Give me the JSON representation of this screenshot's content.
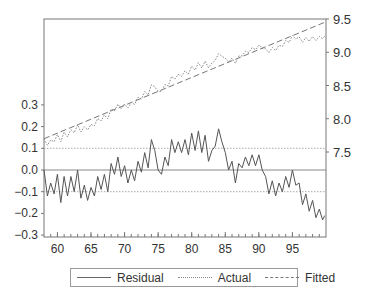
{
  "chart_data": {
    "type": "line",
    "title": "",
    "xlabel": "",
    "ylabel_left": "Residual",
    "ylabel_right": "Actual / Fitted",
    "x_ticks": [
      60,
      65,
      70,
      75,
      80,
      85,
      90,
      95
    ],
    "x_tick_labels": [
      "60",
      "65",
      "70",
      "75",
      "80",
      "85",
      "90",
      "95"
    ],
    "xlim": [
      58,
      100
    ],
    "y_left_ticks": [
      0.3,
      0.2,
      0.1,
      0.0,
      -0.1,
      -0.2,
      -0.3
    ],
    "y_left_tick_labels": [
      "0.3",
      "0.2",
      "0.1",
      "0.0",
      "−0.1",
      "−0.2",
      "−0.3"
    ],
    "y_left_lim": [
      -0.3,
      0.7
    ],
    "y_right_ticks": [
      9.5,
      9.0,
      8.5,
      8.0,
      7.5
    ],
    "y_right_tick_labels": [
      "9.5",
      "9.0",
      "8.5",
      "8.0",
      "7.5"
    ],
    "y_right_lim": [
      7.14,
      9.5
    ],
    "reference_lines_residual": [
      0.1,
      0.0,
      -0.1
    ],
    "x": [
      58,
      58.5,
      59,
      59.5,
      60,
      60.5,
      61,
      61.5,
      62,
      62.5,
      63,
      63.5,
      64,
      64.5,
      65,
      65.5,
      66,
      66.5,
      67,
      67.5,
      68,
      68.5,
      69,
      69.5,
      70,
      70.5,
      71,
      71.5,
      72,
      72.5,
      73,
      73.5,
      74,
      74.5,
      75,
      75.5,
      76,
      76.5,
      77,
      77.5,
      78,
      78.5,
      79,
      79.5,
      80,
      80.5,
      81,
      81.5,
      82,
      82.5,
      83,
      83.5,
      84,
      84.5,
      85,
      85.5,
      86,
      86.5,
      87,
      87.5,
      88,
      88.5,
      89,
      89.5,
      90,
      90.5,
      91,
      91.5,
      92,
      92.5,
      93,
      93.5,
      94,
      94.5,
      95,
      95.5,
      96,
      96.5,
      97,
      97.5,
      98,
      98.5,
      99,
      99.5,
      99.8
    ],
    "series": [
      {
        "name": "Residual",
        "axis": "left",
        "style": "solid",
        "values": [
          0.0,
          -0.12,
          -0.06,
          -0.11,
          -0.02,
          -0.15,
          -0.03,
          -0.12,
          -0.03,
          -0.1,
          0.0,
          -0.13,
          -0.07,
          -0.14,
          -0.08,
          -0.12,
          -0.03,
          -0.09,
          -0.02,
          -0.1,
          0.03,
          -0.02,
          0.06,
          -0.03,
          0.02,
          -0.06,
          0.0,
          -0.05,
          0.04,
          -0.01,
          0.08,
          0.01,
          0.14,
          0.09,
          0.0,
          -0.02,
          0.06,
          0.02,
          0.14,
          0.08,
          0.13,
          0.08,
          0.14,
          0.07,
          0.17,
          0.09,
          0.18,
          0.08,
          0.16,
          0.04,
          0.09,
          0.11,
          0.19,
          0.13,
          0.08,
          0.0,
          0.04,
          -0.06,
          0.03,
          0.01,
          0.06,
          0.02,
          0.07,
          0.02,
          0.07,
          0.0,
          -0.03,
          -0.11,
          -0.05,
          -0.12,
          -0.06,
          -0.1,
          -0.03,
          -0.08,
          0.0,
          -0.07,
          -0.06,
          -0.16,
          -0.11,
          -0.19,
          -0.14,
          -0.22,
          -0.18,
          -0.23,
          -0.21
        ]
      },
      {
        "name": "Actual",
        "axis": "right",
        "style": "dotted"
      },
      {
        "name": "Fitted",
        "axis": "right",
        "style": "dashed",
        "start": {
          "x": 58,
          "y": 7.7
        },
        "end": {
          "x": 99.8,
          "y": 9.45
        }
      }
    ],
    "legend": {
      "position": "bottom",
      "entries": [
        "Residual",
        "Actual",
        "Fitted"
      ]
    },
    "grid": false
  },
  "legend": {
    "residual": "Residual",
    "actual": "Actual",
    "fitted": "Fitted"
  }
}
